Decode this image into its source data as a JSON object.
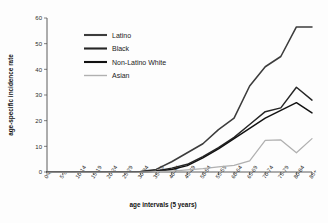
{
  "chart_data": {
    "type": "line",
    "title": "",
    "xlabel": "age intervals (5 years)",
    "ylabel": "age-specific incidence rate",
    "ylim": [
      0,
      60
    ],
    "yticks": [
      0,
      10,
      20,
      30,
      40,
      50,
      60
    ],
    "grid": false,
    "legend_position": "upper-left-inside",
    "categories": [
      "0-4",
      "5-9",
      "10-14",
      "15-19",
      "20-24",
      "25-29",
      "30-34",
      "35-39",
      "40-44",
      "45-49",
      "50-54",
      "55-59",
      "60-64",
      "65-69",
      "70-74",
      "75-79",
      "80-84",
      "85+"
    ],
    "series": [
      {
        "name": "Latino",
        "color": "#3c3c3c",
        "values": [
          0,
          0,
          0,
          0,
          0,
          0,
          0.2,
          1.0,
          4.0,
          7.5,
          11.0,
          16.5,
          21.0,
          33.5,
          41.0,
          45.0,
          56.5,
          56.5
        ]
      },
      {
        "name": "Black",
        "color": "#262626",
        "values": [
          0,
          0,
          0,
          0,
          0,
          0,
          0.1,
          0.4,
          1.5,
          3.0,
          6.0,
          9.5,
          13.5,
          18.5,
          23.5,
          25.0,
          33.0,
          28.0
        ]
      },
      {
        "name": "Non-Latino White",
        "color": "#111111",
        "values": [
          0,
          0,
          0,
          0,
          0,
          0,
          0.1,
          0.3,
          1.0,
          2.5,
          5.5,
          9.0,
          13.0,
          17.0,
          21.0,
          24.0,
          27.0,
          23.0
        ]
      },
      {
        "name": "Asian",
        "color": "#b0b0b0",
        "values": [
          0,
          0,
          0,
          0,
          0,
          0,
          0,
          0.1,
          0.3,
          0.8,
          1.3,
          2.0,
          2.6,
          4.3,
          12.3,
          12.5,
          7.5,
          13.0
        ]
      }
    ]
  },
  "legend": {
    "items": [
      {
        "label": "Latino",
        "color": "#3c3c3c"
      },
      {
        "label": "Black",
        "color": "#262626"
      },
      {
        "label": "Non-Latino White",
        "color": "#111111"
      },
      {
        "label": "Asian",
        "color": "#b0b0b0"
      }
    ]
  }
}
